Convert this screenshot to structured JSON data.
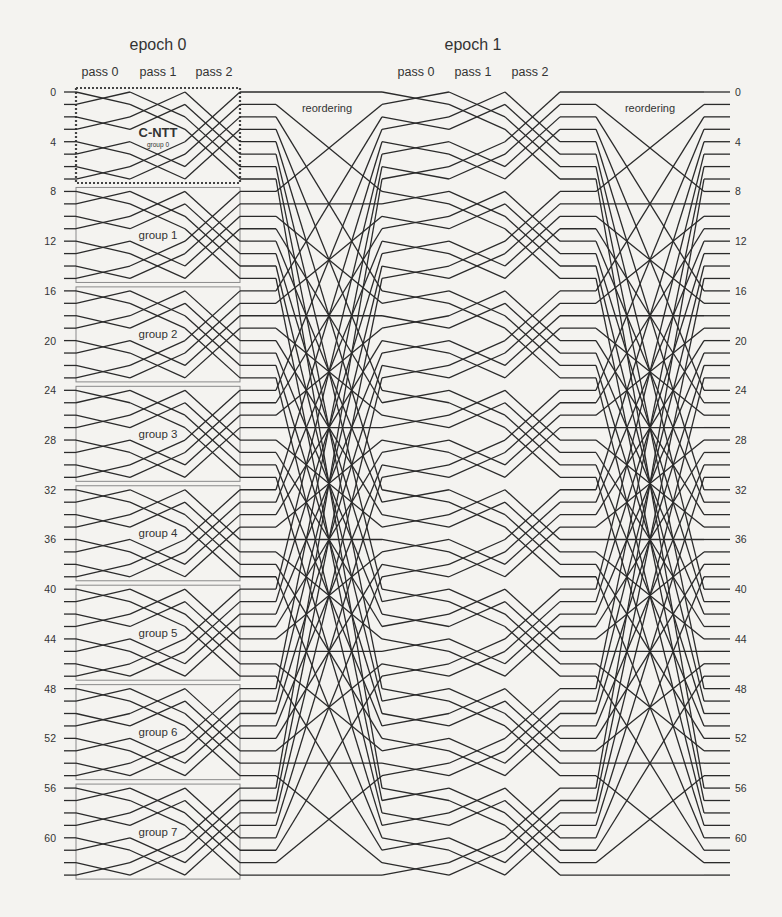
{
  "figure": {
    "epochs": [
      {
        "label": "epoch 0",
        "passes": [
          "pass 0",
          "pass 1",
          "pass 2"
        ]
      },
      {
        "label": "epoch 1",
        "passes": [
          "pass 0",
          "pass 1",
          "pass 2"
        ]
      }
    ],
    "reordering_label": "reordering",
    "cntt_label": "C-NTT",
    "groups": [
      "group 0",
      "group 1",
      "group 2",
      "group 3",
      "group 4",
      "group 5",
      "group 6",
      "group 7"
    ],
    "left_axis_ticks": [
      0,
      4,
      8,
      12,
      16,
      20,
      24,
      28,
      32,
      36,
      40,
      44,
      48,
      52,
      56,
      60
    ],
    "right_axis_ticks": [
      0,
      4,
      8,
      12,
      16,
      20,
      24,
      28,
      32,
      36,
      40,
      44,
      48,
      52,
      56,
      60
    ],
    "num_wires": 64,
    "group_size": 8,
    "butterfly_distances": [
      1,
      2,
      4
    ],
    "reordering": "transpose 8x8",
    "colors": {
      "line": "#2b2b2b",
      "box": "#8a8a8a",
      "text": "#333333",
      "background": "#f4f3f0"
    }
  }
}
